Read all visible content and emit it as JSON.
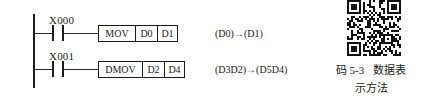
{
  "diagram": {
    "type": "plc-ladder-diagram",
    "rungs": [
      {
        "contact": {
          "label": "X000",
          "type": "normally-open-contact"
        },
        "instruction": {
          "mnemonic": "MOV",
          "operand1": "D0",
          "operand2": "D1"
        },
        "annotation": "(D0)→(D1)"
      },
      {
        "contact": {
          "label": "X001",
          "type": "normally-open-contact"
        },
        "instruction": {
          "mnemonic": "DMOV",
          "operand1": "D2",
          "operand2": "D4"
        },
        "annotation": "(D3D2)→(D5D4)"
      }
    ]
  },
  "qr": {
    "icon": "qr-code-icon",
    "caption_line1_prefix": "码 5-3",
    "caption_line1_suffix": "数据表",
    "caption_line2": "示方法"
  },
  "colors": {
    "ink": "#1b1b1b",
    "background": "#ffffff"
  }
}
